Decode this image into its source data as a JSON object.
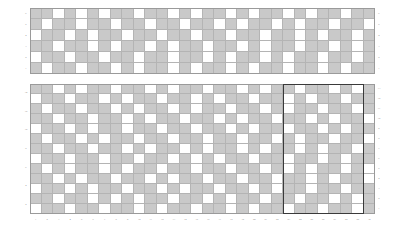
{
  "figure": {
    "type": "binary-grid-heatmap",
    "background": "#ffffff",
    "cell_on_color": "#c9c9c9",
    "cell_off_color": "#ffffff",
    "gridline_color": "#b4b4b4",
    "selection_border_color": "#3a3a3a"
  },
  "chart_data": {
    "type": "heatmap",
    "title": "",
    "xlabel": "",
    "ylabel": "",
    "panels": [
      {
        "name": "top-panel",
        "rows": 6,
        "cols": 30,
        "x_ticks": [
          "1",
          "2",
          "3",
          "4",
          "5",
          "6",
          "7",
          "8",
          "9",
          "10",
          "11",
          "12",
          "13",
          "14",
          "15",
          "16",
          "17",
          "18",
          "19",
          "20",
          "21",
          "22",
          "23",
          "24",
          "25",
          "26",
          "27",
          "28",
          "29",
          "30"
        ],
        "y_ticks_left": [
          "1",
          "2",
          "3",
          "4",
          "5",
          "6"
        ],
        "y_ticks_right": [
          "1",
          "2",
          "3",
          "4",
          "5",
          "6"
        ],
        "matrix": [
          [
            1,
            1,
            0,
            1,
            0,
            1,
            0,
            1,
            1,
            0,
            1,
            1,
            0,
            1,
            0,
            1,
            1,
            0,
            1,
            0,
            1,
            1,
            0,
            1,
            0,
            1,
            1,
            0,
            1,
            1
          ],
          [
            1,
            0,
            1,
            1,
            0,
            1,
            1,
            0,
            1,
            1,
            0,
            1,
            1,
            0,
            1,
            1,
            0,
            1,
            0,
            1,
            1,
            0,
            1,
            0,
            1,
            1,
            0,
            1,
            1,
            0
          ],
          [
            0,
            1,
            1,
            0,
            1,
            0,
            1,
            1,
            0,
            1,
            1,
            0,
            1,
            1,
            0,
            1,
            1,
            0,
            1,
            1,
            0,
            1,
            1,
            0,
            1,
            0,
            1,
            1,
            0,
            1
          ],
          [
            1,
            1,
            0,
            1,
            1,
            0,
            1,
            0,
            1,
            1,
            0,
            1,
            0,
            1,
            1,
            0,
            1,
            1,
            0,
            1,
            0,
            1,
            1,
            0,
            1,
            1,
            0,
            1,
            0,
            1
          ],
          [
            0,
            1,
            1,
            0,
            1,
            1,
            0,
            1,
            1,
            0,
            1,
            1,
            0,
            1,
            1,
            0,
            1,
            0,
            1,
            1,
            0,
            1,
            0,
            1,
            1,
            0,
            1,
            1,
            0,
            1
          ],
          [
            1,
            0,
            1,
            1,
            0,
            1,
            1,
            0,
            1,
            0,
            1,
            1,
            0,
            1,
            0,
            1,
            1,
            0,
            1,
            0,
            1,
            1,
            0,
            1,
            1,
            0,
            1,
            0,
            1,
            1
          ]
        ]
      },
      {
        "name": "bottom-panel",
        "rows": 13,
        "cols": 30,
        "x_ticks": [
          "1",
          "2",
          "3",
          "4",
          "5",
          "6",
          "7",
          "8",
          "9",
          "10",
          "11",
          "12",
          "13",
          "14",
          "15",
          "16",
          "17",
          "18",
          "19",
          "20",
          "21",
          "22",
          "23",
          "24",
          "25",
          "26",
          "27",
          "28",
          "29",
          "30"
        ],
        "y_ticks_left": [
          "2",
          "4",
          "6",
          "8",
          "10",
          "12",
          "14"
        ],
        "y_ticks_right": [
          "1",
          "2",
          "3",
          "4",
          "5",
          "6",
          "7",
          "8",
          "9",
          "10",
          "11",
          "12",
          "13"
        ],
        "matrix": [
          [
            1,
            1,
            0,
            1,
            0,
            1,
            1,
            0,
            1,
            1,
            0,
            1,
            0,
            1,
            1,
            0,
            1,
            1,
            0,
            1,
            0,
            1,
            1,
            0,
            1,
            1,
            0,
            1,
            0,
            1
          ],
          [
            0,
            1,
            1,
            0,
            1,
            1,
            0,
            1,
            0,
            1,
            1,
            0,
            1,
            1,
            0,
            1,
            0,
            1,
            1,
            0,
            1,
            1,
            0,
            1,
            0,
            1,
            1,
            0,
            1,
            1
          ],
          [
            1,
            0,
            1,
            1,
            0,
            1,
            1,
            0,
            1,
            0,
            1,
            1,
            0,
            1,
            0,
            1,
            1,
            0,
            1,
            1,
            0,
            1,
            0,
            1,
            1,
            0,
            1,
            1,
            0,
            1
          ],
          [
            1,
            1,
            0,
            1,
            1,
            0,
            1,
            1,
            0,
            1,
            0,
            1,
            1,
            0,
            1,
            1,
            0,
            1,
            0,
            1,
            1,
            0,
            1,
            1,
            0,
            1,
            0,
            1,
            1,
            0
          ],
          [
            0,
            1,
            1,
            0,
            1,
            0,
            1,
            1,
            0,
            1,
            1,
            0,
            1,
            1,
            0,
            1,
            1,
            0,
            1,
            0,
            1,
            1,
            0,
            1,
            1,
            0,
            1,
            0,
            1,
            1
          ],
          [
            1,
            0,
            1,
            1,
            0,
            1,
            0,
            1,
            1,
            0,
            1,
            1,
            0,
            1,
            1,
            0,
            1,
            1,
            0,
            1,
            1,
            0,
            1,
            0,
            1,
            1,
            0,
            1,
            1,
            0
          ],
          [
            1,
            1,
            0,
            1,
            1,
            0,
            1,
            1,
            0,
            1,
            0,
            1,
            1,
            0,
            1,
            0,
            1,
            1,
            0,
            1,
            0,
            1,
            1,
            0,
            1,
            0,
            1,
            1,
            0,
            1
          ],
          [
            0,
            1,
            1,
            0,
            1,
            1,
            0,
            1,
            1,
            0,
            1,
            1,
            0,
            1,
            0,
            1,
            0,
            1,
            1,
            0,
            1,
            1,
            0,
            1,
            1,
            0,
            1,
            0,
            1,
            1
          ],
          [
            1,
            0,
            1,
            0,
            1,
            1,
            0,
            1,
            0,
            1,
            1,
            0,
            1,
            1,
            0,
            1,
            1,
            0,
            1,
            1,
            0,
            1,
            0,
            1,
            0,
            1,
            1,
            0,
            1,
            0
          ],
          [
            1,
            1,
            0,
            1,
            0,
            1,
            1,
            0,
            1,
            1,
            0,
            1,
            0,
            1,
            1,
            0,
            1,
            1,
            0,
            1,
            1,
            0,
            1,
            1,
            0,
            1,
            0,
            1,
            1,
            0
          ],
          [
            0,
            1,
            1,
            0,
            1,
            0,
            1,
            1,
            0,
            1,
            1,
            0,
            1,
            0,
            1,
            1,
            0,
            1,
            1,
            0,
            1,
            0,
            1,
            1,
            0,
            1,
            1,
            0,
            1,
            1
          ],
          [
            1,
            1,
            0,
            1,
            1,
            0,
            1,
            0,
            1,
            0,
            1,
            1,
            0,
            1,
            1,
            0,
            1,
            0,
            1,
            1,
            0,
            1,
            1,
            0,
            1,
            1,
            0,
            1,
            0,
            1
          ],
          [
            0,
            1,
            1,
            0,
            1,
            1,
            0,
            1,
            1,
            0,
            1,
            0,
            1,
            1,
            0,
            1,
            1,
            0,
            1,
            0,
            1,
            1,
            0,
            1,
            1,
            0,
            1,
            1,
            0,
            1
          ]
        ],
        "selection": {
          "name": "highlight-rectangle",
          "col_start": 23,
          "col_end": 29,
          "row_start": 1,
          "row_end": 13
        }
      }
    ],
    "grid": true,
    "legend_position": "none"
  }
}
